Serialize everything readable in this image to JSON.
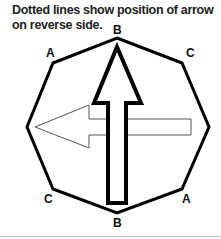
{
  "caption": {
    "line1": "Dotted lines show position of arrow",
    "line2": "on reverse side."
  },
  "labels": {
    "top": "B",
    "top_left": "A",
    "top_right": "C",
    "bottom_left": "C",
    "bottom_right": "A",
    "bottom": "B"
  },
  "colors": {
    "outline": "#000000",
    "reverse_arrow": "#555555",
    "background": "#ffffff"
  }
}
